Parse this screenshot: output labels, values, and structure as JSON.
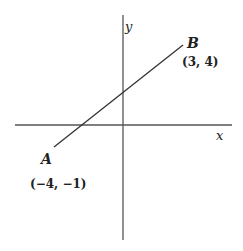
{
  "diagram": {
    "type": "coordinate-plane-line-segment",
    "axes": {
      "x_label": "x",
      "y_label": "y"
    },
    "points": [
      {
        "name": "A",
        "coords_label": "(−4, −1)",
        "x": -4,
        "y": -1
      },
      {
        "name": "B",
        "coords_label": "(3, 4)",
        "x": 3,
        "y": 4
      }
    ],
    "colors": {
      "line": "#333333",
      "axis": "#444444",
      "text": "#222222"
    }
  }
}
